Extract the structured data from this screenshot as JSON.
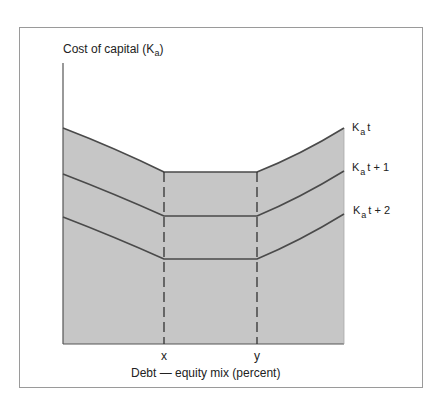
{
  "diagram": {
    "y_axis_label": {
      "prefix": "Cost of capital (K",
      "sub": "a",
      "suffix": ")"
    },
    "x_axis_label": "Debt — equity mix (percent)",
    "x_markers": [
      {
        "label": "x",
        "x": 164
      },
      {
        "label": "y",
        "x": 257
      }
    ],
    "curves": [
      {
        "name": "Kat",
        "label_main": "K",
        "label_sub": "a",
        "label_suffix": "t",
        "left_y": 128,
        "flat_y": 172,
        "right_y": 128
      },
      {
        "name": "Kat+1",
        "label_main": "K",
        "label_sub": "a",
        "label_suffix": "t + 1",
        "left_y": 174,
        "flat_y": 216,
        "right_y": 171
      },
      {
        "name": "Kat+2",
        "label_main": "K",
        "label_sub": "a",
        "label_suffix": "t + 2",
        "left_y": 217,
        "flat_y": 259,
        "right_y": 214
      }
    ],
    "colors": {
      "fill": "#c6c6c6",
      "line": "#4a4a4a",
      "axis": "#555555"
    }
  }
}
